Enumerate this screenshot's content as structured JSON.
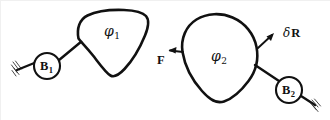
{
  "figure": {
    "canvas": {
      "width": 330,
      "height": 120,
      "background": "#ffffff"
    },
    "ink_color": "#111111"
  },
  "bodies": [
    {
      "id": "body-1",
      "label": "φ",
      "subscript": "1",
      "shape": "rounded-triangle",
      "label_position": {
        "x": 104,
        "y": 24
      }
    },
    {
      "id": "body-2",
      "label": "φ",
      "subscript": "2",
      "shape": "teardrop-oval",
      "label_position": {
        "x": 211,
        "y": 49
      }
    }
  ],
  "joints": [
    {
      "id": "joint-b1",
      "label": "B",
      "subscript": "1",
      "center": {
        "x": 47,
        "y": 66
      },
      "radius": 13,
      "label_position": {
        "x": 40,
        "y": 60
      }
    },
    {
      "id": "joint-b2",
      "label": "B",
      "subscript": "2",
      "center": {
        "x": 289,
        "y": 90
      },
      "radius": 13,
      "label_position": {
        "x": 282,
        "y": 84
      }
    }
  ],
  "annotations": [
    {
      "id": "force-f",
      "text": "F",
      "kind": "force-vector",
      "direction": "left",
      "label_position": {
        "x": 157,
        "y": 54
      }
    },
    {
      "id": "displacement-dr",
      "delta": "δ",
      "vector": "R",
      "kind": "displacement-vector",
      "direction": "up-right",
      "label_position": {
        "x": 283,
        "y": 27
      }
    }
  ],
  "supports": [
    {
      "id": "ground-support-left",
      "type": "hatched-ground",
      "position": {
        "x": 14,
        "y": 70
      }
    },
    {
      "id": "ground-support-right",
      "type": "hatched-ground",
      "position": {
        "x": 315,
        "y": 103
      }
    }
  ],
  "links": [
    {
      "id": "link-ground-to-b1",
      "from": "ground-support-left",
      "to": "joint-b1"
    },
    {
      "id": "link-b1-to-body1",
      "from": "joint-b1",
      "to": "body-1"
    },
    {
      "id": "link-body2-to-b2",
      "from": "body-2",
      "to": "joint-b2"
    },
    {
      "id": "link-b2-to-ground",
      "from": "joint-b2",
      "to": "ground-support-right"
    }
  ]
}
